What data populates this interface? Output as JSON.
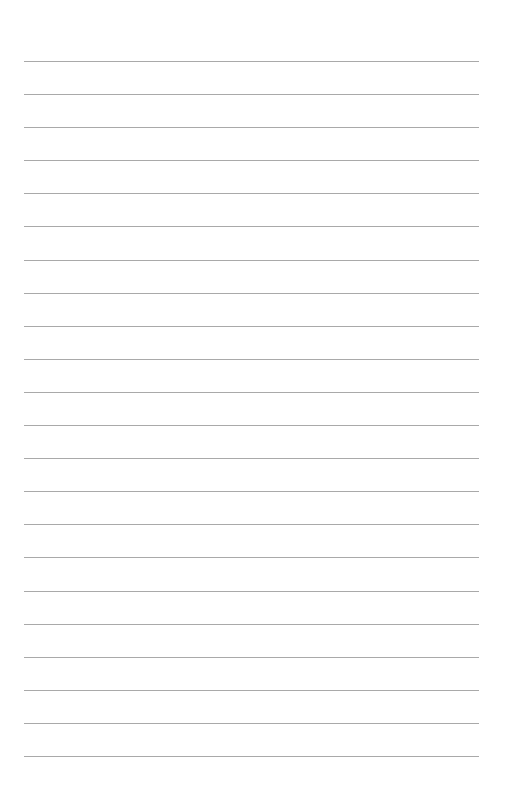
{
  "document": {
    "type": "lined-paper",
    "line_count": 22,
    "line_color": "#a9a9a9",
    "background_color": "#ffffff"
  }
}
